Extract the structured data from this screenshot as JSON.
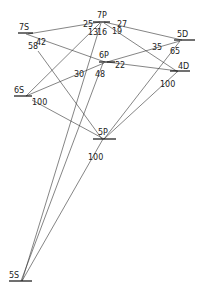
{
  "diagram": {
    "type": "grotrian-energy-level",
    "levels": [
      {
        "id": "7S",
        "label": "7S",
        "x1": 18,
        "x2": 33,
        "y": 33,
        "lx": 19,
        "ly": 30
      },
      {
        "id": "7P",
        "label": "7P",
        "x1": 93,
        "x2": 110,
        "y": 22,
        "lx": 97,
        "ly": 18
      },
      {
        "id": "5D",
        "label": "5D",
        "x1": 174,
        "x2": 195,
        "y": 40,
        "lx": 177,
        "ly": 37
      },
      {
        "id": "6P",
        "label": "6P",
        "x1": 99,
        "x2": 115,
        "y": 62,
        "lx": 99,
        "ly": 58
      },
      {
        "id": "4D",
        "label": "4D",
        "x1": 170,
        "x2": 190,
        "y": 71,
        "lx": 178,
        "ly": 69
      },
      {
        "id": "6S",
        "label": "6S",
        "x1": 14,
        "x2": 32,
        "y": 96,
        "lx": 14,
        "ly": 93
      },
      {
        "id": "5P",
        "label": "5P",
        "x1": 93,
        "x2": 116,
        "y": 139,
        "lx": 98,
        "ly": 135
      },
      {
        "id": "5S",
        "label": "5S",
        "x1": 9,
        "x2": 32,
        "y": 281,
        "lx": 9,
        "ly": 278
      }
    ],
    "transitions": [
      {
        "from": "7P",
        "to": "7S",
        "x1": 100,
        "y1": 22,
        "x2": 28,
        "y2": 34,
        "label": "25",
        "tx": 83,
        "ty": 27
      },
      {
        "from": "7P",
        "to": "6S",
        "x1": 100,
        "y1": 23,
        "x2": 26,
        "y2": 96,
        "label": "13",
        "tx": 88,
        "ty": 35
      },
      {
        "from": "7P",
        "to": "5S",
        "x1": 101,
        "y1": 23,
        "x2": 22,
        "y2": 281,
        "label": "16",
        "tx": 97,
        "ty": 35
      },
      {
        "from": "7P",
        "to": "5D",
        "x1": 104,
        "y1": 22,
        "x2": 182,
        "y2": 40,
        "label": "27",
        "tx": 117,
        "ty": 27
      },
      {
        "from": "7P",
        "to": "4D",
        "x1": 104,
        "y1": 23,
        "x2": 178,
        "y2": 72,
        "label": "19",
        "tx": 112,
        "ty": 34
      },
      {
        "from": "7S",
        "to": "6P",
        "x1": 26,
        "y1": 34,
        "x2": 105,
        "y2": 62,
        "label": "42",
        "tx": 36,
        "ty": 45
      },
      {
        "from": "7S",
        "to": "5P",
        "x1": 38,
        "y1": 51,
        "x2": 102,
        "y2": 139,
        "label": "58",
        "tx": 28,
        "ty": 49
      },
      {
        "from": "6P",
        "to": "6S",
        "x1": 104,
        "y1": 63,
        "x2": 26,
        "y2": 96,
        "label": "30",
        "tx": 74,
        "ty": 77
      },
      {
        "from": "6P",
        "to": "5S",
        "x1": 103,
        "y1": 63,
        "x2": 21,
        "y2": 281,
        "label": "48",
        "tx": 95,
        "ty": 77
      },
      {
        "from": "6P",
        "to": "4D",
        "x1": 107,
        "y1": 62,
        "x2": 178,
        "y2": 71,
        "label": "22",
        "tx": 115,
        "ty": 68
      },
      {
        "from": "6P",
        "to": "5D",
        "x1": 107,
        "y1": 62,
        "x2": 180,
        "y2": 41,
        "label": "35",
        "tx": 152,
        "ty": 50
      },
      {
        "from": "5D",
        "to": "5P",
        "x1": 180,
        "y1": 41,
        "x2": 104,
        "y2": 139,
        "label": "65",
        "tx": 170,
        "ty": 54
      },
      {
        "from": "4D",
        "to": "5P",
        "x1": 177,
        "y1": 72,
        "x2": 104,
        "y2": 139,
        "label": "100",
        "tx": 160,
        "ty": 87
      },
      {
        "from": "6S",
        "to": "5P",
        "x1": 32,
        "y1": 100,
        "x2": 104,
        "y2": 139,
        "label": "100",
        "tx": 32,
        "ty": 105
      },
      {
        "from": "5P",
        "to": "5S",
        "x1": 103,
        "y1": 139,
        "x2": 22,
        "y2": 281,
        "label": "100",
        "tx": 88,
        "ty": 160
      }
    ]
  }
}
